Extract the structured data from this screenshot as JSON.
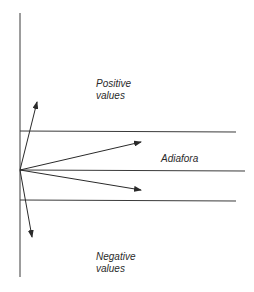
{
  "diagram": {
    "labels": {
      "positive_line1": "Positive",
      "positive_line2": "values",
      "adiafora": "Adiafora",
      "negative_line1": "Negative",
      "negative_line2": "values"
    },
    "colors": {
      "line": "#3a3a3a",
      "text": "#2a2a2a",
      "background": "#ffffff"
    }
  }
}
